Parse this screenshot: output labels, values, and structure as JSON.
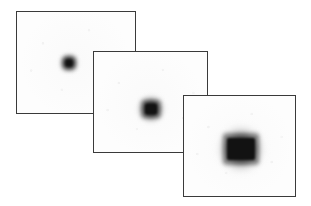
{
  "figure": {
    "background_color": "#ffffff",
    "panel_fill_color": "#fdfdfd",
    "panel_border_color": "#3a3a3a",
    "blob_color": "#121212",
    "panel_count": 3
  },
  "panels": [
    {
      "id": "panel-1",
      "name": "back-panel",
      "order": 1,
      "z": 1,
      "x": 16,
      "y": 11,
      "width": 120,
      "height": 103,
      "blob": {
        "name": "spot-small",
        "center_x": 52,
        "center_y": 51,
        "halo_size": 26,
        "mid_width": 13,
        "mid_height": 13,
        "core_width": 7,
        "core_height": 7
      }
    },
    {
      "id": "panel-2",
      "name": "middle-panel",
      "order": 2,
      "z": 2,
      "x": 93,
      "y": 51,
      "width": 115,
      "height": 102,
      "blob": {
        "name": "spot-medium",
        "center_x": 57,
        "center_y": 57,
        "halo_size": 36,
        "mid_width": 19,
        "mid_height": 18,
        "core_width": 12,
        "core_height": 11
      }
    },
    {
      "id": "panel-3",
      "name": "front-panel",
      "order": 3,
      "z": 3,
      "x": 183,
      "y": 95,
      "width": 113,
      "height": 102,
      "blob": {
        "name": "spot-large",
        "center_x": 57,
        "center_y": 53,
        "halo_size": 58,
        "mid_width": 36,
        "mid_height": 31,
        "core_width": 28,
        "core_height": 22
      }
    }
  ],
  "chart_data": {
    "type": "heatmap",
    "subtitle": "",
    "xlabel": "",
    "ylabel": "",
    "grid": false,
    "legend": "none",
    "panels": [
      {
        "label": "Frame 1",
        "spot_diameter_core_px": 7,
        "spot_diameter_halo_px": 26,
        "peak_intensity": 0.93,
        "relative_blur": 1.0
      },
      {
        "label": "Frame 2",
        "spot_diameter_core_px": 12,
        "spot_diameter_halo_px": 36,
        "peak_intensity": 0.95,
        "relative_blur": 1.6
      },
      {
        "label": "Frame 3",
        "spot_diameter_core_px": 28,
        "spot_diameter_halo_px": 58,
        "peak_intensity": 0.97,
        "relative_blur": 2.6
      }
    ]
  }
}
